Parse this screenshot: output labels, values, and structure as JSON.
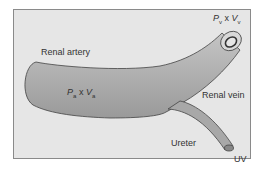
{
  "diagram": {
    "labels": {
      "renal_artery": "Renal artery",
      "renal_vein": "Renal vein",
      "ureter": "Ureter",
      "uv": "UV",
      "artery_formula": {
        "p": "P",
        "p_sub": "a",
        "x": "x",
        "v": "V",
        "v_sub": "a"
      },
      "vein_formula": {
        "p": "P",
        "p_sub": "v",
        "x": "x",
        "v": "V",
        "v_sub": "v"
      }
    },
    "colors": {
      "background": "#e6e6e6",
      "vessel_fill": "#a8a8a8",
      "outline": "#444444",
      "text": "#333333"
    }
  }
}
